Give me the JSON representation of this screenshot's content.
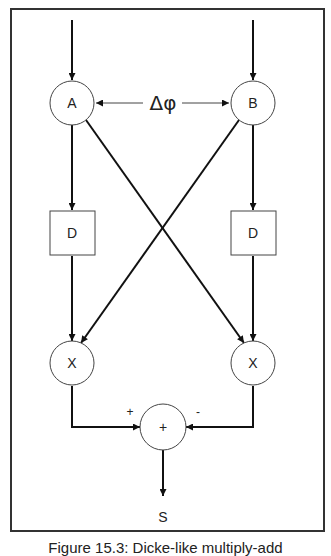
{
  "diagram": {
    "type": "signal-flow",
    "nodes": {
      "input_a": {
        "label": "A"
      },
      "input_b": {
        "label": "B"
      },
      "delay_left": {
        "label": "D"
      },
      "delay_right": {
        "label": "D"
      },
      "mult_left": {
        "label": "X"
      },
      "mult_right": {
        "label": "X"
      },
      "summer": {
        "label": "+"
      }
    },
    "phase_label": "Δφ",
    "sum_inputs": {
      "left_sign": "+",
      "right_sign": "-"
    },
    "output_label": "S",
    "colors": {
      "line": "#111111",
      "node_stroke": "#444444",
      "background": "#ffffff"
    }
  },
  "caption": "Figure 15.3: Dicke-like multiply-add"
}
